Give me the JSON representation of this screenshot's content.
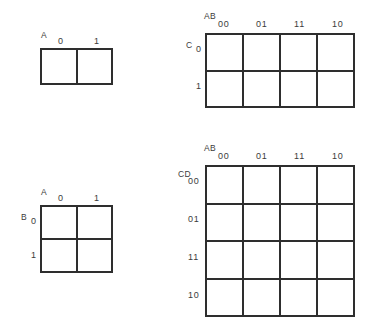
{
  "page": {
    "background_color": "#ffffff",
    "line_color": "#2e2e2e",
    "text_color": "#3b3b3b"
  },
  "maps": [
    {
      "id": "map-a",
      "name": "one-variable-kmap",
      "variables": 1,
      "columns": 2,
      "rows": 1,
      "column_variable_label": "A",
      "row_variable_label": "",
      "column_headers": [
        "0",
        "1"
      ],
      "row_headers": [],
      "cells": [
        [
          "",
          ""
        ]
      ]
    },
    {
      "id": "map-abc",
      "name": "three-variable-kmap",
      "variables": 3,
      "columns": 4,
      "rows": 2,
      "column_variable_label": "AB",
      "row_variable_label": "C",
      "column_headers": [
        "00",
        "01",
        "11",
        "10"
      ],
      "row_headers": [
        "0",
        "1"
      ],
      "cells": [
        [
          "",
          "",
          "",
          ""
        ],
        [
          "",
          "",
          "",
          ""
        ]
      ]
    },
    {
      "id": "map-ab",
      "name": "two-variable-kmap",
      "variables": 2,
      "columns": 2,
      "rows": 2,
      "column_variable_label": "A",
      "row_variable_label": "B",
      "column_headers": [
        "0",
        "1"
      ],
      "row_headers": [
        "0",
        "1"
      ],
      "cells": [
        [
          "",
          ""
        ],
        [
          "",
          ""
        ]
      ]
    },
    {
      "id": "map-abcd",
      "name": "four-variable-kmap",
      "variables": 4,
      "columns": 4,
      "rows": 4,
      "column_variable_label": "AB",
      "row_variable_label": "CD",
      "column_headers": [
        "00",
        "01",
        "11",
        "10"
      ],
      "row_headers": [
        "00",
        "01",
        "11",
        "10"
      ],
      "cells": [
        [
          "",
          "",
          "",
          ""
        ],
        [
          "",
          "",
          "",
          ""
        ],
        [
          "",
          "",
          "",
          ""
        ],
        [
          "",
          "",
          "",
          ""
        ]
      ]
    }
  ]
}
